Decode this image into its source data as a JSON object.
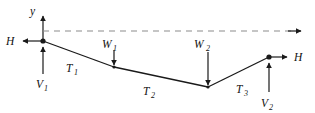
{
  "figure": {
    "kind": "free-body-diagram",
    "background_color": "#ffffff",
    "line_color": "#1a1a1a",
    "dashed_color": "#8c8c8c"
  },
  "axes": {
    "y_axis": {
      "label": "y",
      "direction": "up",
      "x": 43,
      "y_top": 14,
      "y_bottom": 41
    },
    "x_axis": {
      "label": "",
      "direction": "right",
      "style": "dashed",
      "y": 31,
      "x_start": 43,
      "x_end": 301
    }
  },
  "nodes": [
    {
      "name": "left-support",
      "x": 43,
      "y": 41
    },
    {
      "name": "load-point-1",
      "x": 114,
      "y": 67
    },
    {
      "name": "load-point-2",
      "x": 208,
      "y": 87
    },
    {
      "name": "right-support",
      "x": 269,
      "y": 57
    }
  ],
  "cable_segments": [
    {
      "name": "T1",
      "label": "T",
      "subscript": "1",
      "from": "left-support",
      "to": "load-point-1",
      "label_x": 70,
      "label_y": 70
    },
    {
      "name": "T2",
      "label": "T",
      "subscript": "2",
      "from": "load-point-1",
      "to": "load-point-2",
      "label_x": 148,
      "label_y": 92
    },
    {
      "name": "T3",
      "label": "T",
      "subscript": "3",
      "from": "load-point-2",
      "to": "right-support",
      "label_x": 240,
      "label_y": 90
    }
  ],
  "forces": [
    {
      "name": "H-left",
      "label": "H",
      "subscript": "",
      "direction": "left",
      "at_node": "left-support",
      "label_x": 8,
      "label_y": 45,
      "arrow": {
        "x1": 43,
        "y1": 41,
        "x2": 22,
        "y2": 41
      }
    },
    {
      "name": "V1",
      "label": "V",
      "subscript": "1",
      "direction": "up",
      "at_node": "left-support",
      "label_x": 38,
      "label_y": 82,
      "arrow": {
        "x1": 43,
        "y1": 74,
        "x2": 43,
        "y2": 46
      }
    },
    {
      "name": "W1",
      "label": "W",
      "subscript": "1",
      "direction": "down",
      "at_node": "load-point-1",
      "label_x": 104,
      "label_y": 47,
      "arrow": {
        "x1": 114,
        "y1": 50,
        "x2": 114,
        "y2": 66
      }
    },
    {
      "name": "W2",
      "label": "W",
      "subscript": "2",
      "direction": "down",
      "at_node": "load-point-2",
      "label_x": 196,
      "label_y": 47,
      "arrow": {
        "x1": 208,
        "y1": 51,
        "x2": 208,
        "y2": 86
      }
    },
    {
      "name": "V2",
      "label": "V",
      "subscript": "2",
      "direction": "up",
      "at_node": "right-support",
      "label_x": 263,
      "label_y": 104,
      "arrow": {
        "x1": 269,
        "y1": 92,
        "x2": 269,
        "y2": 62
      }
    },
    {
      "name": "H-right",
      "label": "H",
      "subscript": "",
      "direction": "right",
      "at_node": "right-support",
      "label_x": 296,
      "label_y": 61,
      "arrow": {
        "x1": 269,
        "y1": 57,
        "x2": 288,
        "y2": 57
      }
    }
  ]
}
